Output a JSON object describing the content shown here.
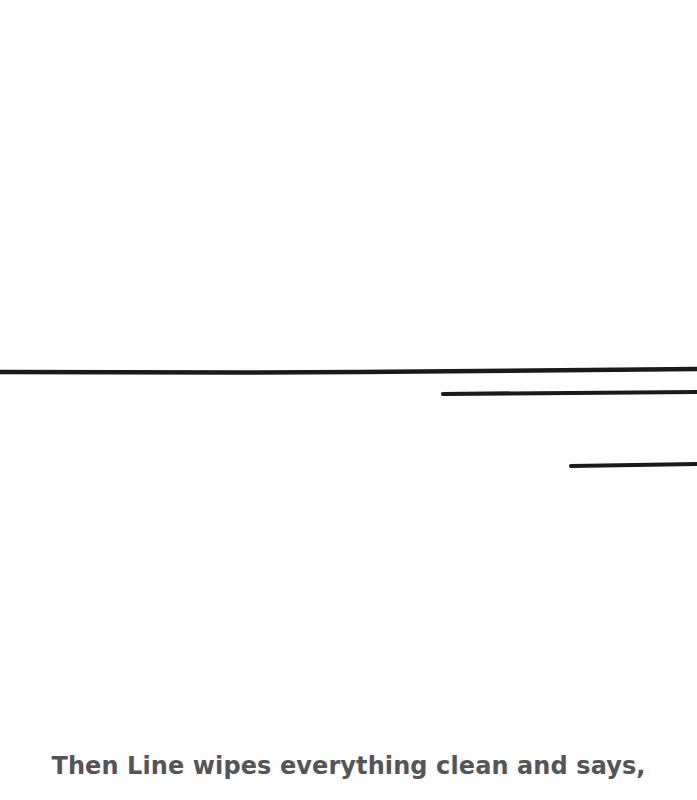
{
  "page": {
    "background": "#fefefe",
    "caption": "Then Line wipes everything clean and says,",
    "caption_color": "#555559"
  },
  "drawing": {
    "stroke_color": "#1a1a1a",
    "lines": [
      {
        "name": "long-line",
        "x1": 0,
        "y1": 372,
        "x2": 697,
        "y2": 369
      },
      {
        "name": "middle-line",
        "x1": 443,
        "y1": 394,
        "x2": 697,
        "y2": 392
      },
      {
        "name": "short-line",
        "x1": 571,
        "y1": 466,
        "x2": 697,
        "y2": 464
      }
    ]
  }
}
